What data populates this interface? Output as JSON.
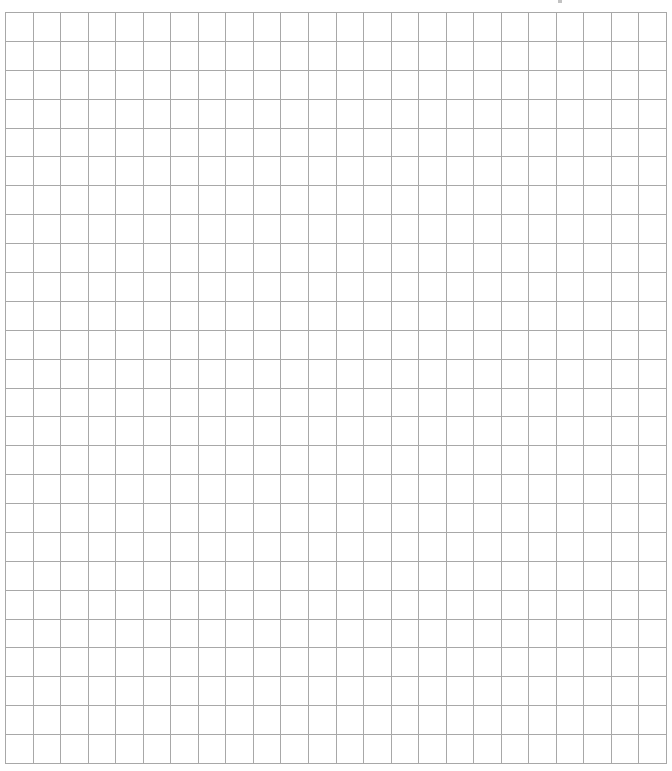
{
  "document": {
    "type": "graph-paper",
    "grid": {
      "columns": 24,
      "rows": 26,
      "line_color": "#a8a8a8",
      "background_color": "#ffffff",
      "left": 5,
      "top": 12,
      "width": 662,
      "height": 752,
      "line_width": 1
    }
  }
}
